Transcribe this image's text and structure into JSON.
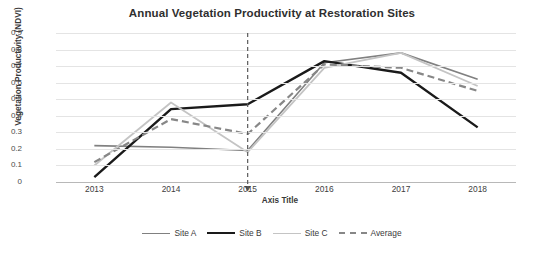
{
  "chart_data": {
    "type": "line",
    "title": "Annual Vegetation Productivity at Restoration Sites",
    "xlabel": "Axis Title",
    "ylabel": "Vegetation Productivity (NDVI)",
    "categories": [
      "2013",
      "2014",
      "2015",
      "2016",
      "2017",
      "2018"
    ],
    "x": [
      2013,
      2014,
      2015,
      2016,
      2017,
      2018
    ],
    "ylim": [
      0,
      0.9
    ],
    "yticks": [
      "0",
      "0.1",
      "0.2",
      "0.3",
      "0.4",
      "0.5",
      "0.6",
      "0.7",
      "0.8",
      "0.9"
    ],
    "ytick_values": [
      0,
      0.1,
      0.2,
      0.3,
      0.4,
      0.5,
      0.6,
      0.7,
      0.8,
      0.9
    ],
    "grid": true,
    "legend_position": "bottom",
    "series": [
      {
        "name": "Site A",
        "values": [
          0.22,
          0.21,
          0.19,
          0.72,
          0.78,
          0.62
        ],
        "color": "#808080",
        "style": "solid",
        "width": 1.6
      },
      {
        "name": "Site B",
        "values": [
          0.03,
          0.44,
          0.47,
          0.73,
          0.66,
          0.33
        ],
        "color": "#1a1a1a",
        "style": "solid",
        "width": 2.4
      },
      {
        "name": "Site C",
        "values": [
          0.1,
          0.48,
          0.18,
          0.69,
          0.78,
          0.58
        ],
        "color": "#c4c4c4",
        "style": "solid",
        "width": 1.8
      },
      {
        "name": "Average",
        "values": [
          0.12,
          0.38,
          0.29,
          0.71,
          0.69,
          0.55
        ],
        "color": "#878787",
        "style": "dashed",
        "width": 2.2
      }
    ],
    "annotations": [
      {
        "type": "vertical-dashed-arrow",
        "at_category": "2015",
        "x": 2015,
        "color": "#5a5a5a",
        "from_value": 0.9,
        "to_value": 0
      }
    ]
  }
}
